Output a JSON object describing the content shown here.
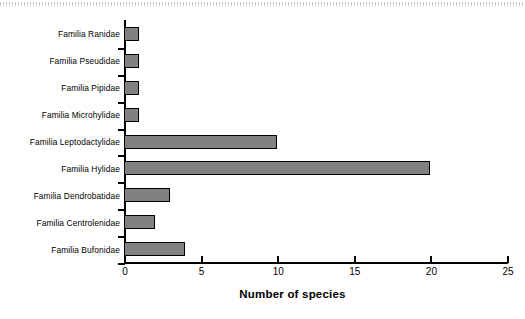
{
  "chart_data": {
    "type": "bar",
    "orientation": "horizontal",
    "title": "",
    "xlabel": "Number of species",
    "ylabel": "",
    "xlim": [
      0,
      25
    ],
    "xticks": [
      0,
      5,
      10,
      15,
      20,
      25
    ],
    "grid": false,
    "legend": null,
    "bar_color": "#818181",
    "bar_edge_color": "#000000",
    "background_color": "#ffffff",
    "categories": [
      "Familia Ranidae",
      "Familia Pseudidae",
      "Familia Pipidae",
      "Familia Microhylidae",
      "Familia Leptodactylidae",
      "Familia Hylidae",
      "Familia Dendrobatidae",
      "Familia Centrolenidae",
      "Familia Bufonidae"
    ],
    "values": [
      1,
      1,
      1,
      1,
      10,
      20,
      3,
      2,
      4
    ]
  }
}
